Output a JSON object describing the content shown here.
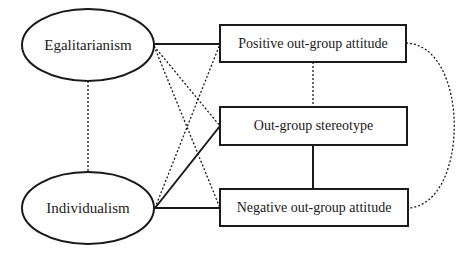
{
  "diagram": {
    "nodes": [
      {
        "id": "egalitarianism",
        "label": "Egalitarianism",
        "shape": "ellipse"
      },
      {
        "id": "individualism",
        "label": "Individualism",
        "shape": "ellipse"
      },
      {
        "id": "positive",
        "label": "Positive out-group attitude",
        "shape": "rect"
      },
      {
        "id": "stereotype",
        "label": "Out-group stereotype",
        "shape": "rect"
      },
      {
        "id": "negative",
        "label": "Negative out-group attitude",
        "shape": "rect"
      }
    ],
    "edges": [
      {
        "from": "egalitarianism",
        "to": "positive",
        "style": "solid"
      },
      {
        "from": "egalitarianism",
        "to": "stereotype",
        "style": "dotted"
      },
      {
        "from": "egalitarianism",
        "to": "negative",
        "style": "dotted"
      },
      {
        "from": "individualism",
        "to": "positive",
        "style": "dotted"
      },
      {
        "from": "individualism",
        "to": "stereotype",
        "style": "solid"
      },
      {
        "from": "individualism",
        "to": "negative",
        "style": "solid"
      },
      {
        "from": "egalitarianism",
        "to": "individualism",
        "style": "dotted"
      },
      {
        "from": "positive",
        "to": "stereotype",
        "style": "dotted"
      },
      {
        "from": "stereotype",
        "to": "negative",
        "style": "solid"
      },
      {
        "from": "positive",
        "to": "negative",
        "style": "dotted-curve"
      }
    ],
    "colors": {
      "stroke": "#1a1a1a",
      "background": "#ffffff"
    }
  }
}
